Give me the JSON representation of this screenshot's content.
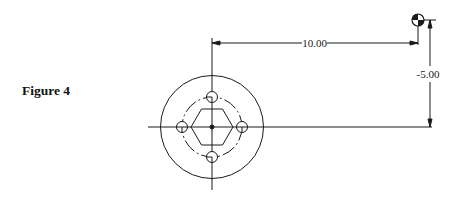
{
  "figure": {
    "label": "Figure 4"
  },
  "drawing": {
    "type": "engineering-drawing",
    "part": "circular flange with hexagonal center and 4-hole bolt circle",
    "dimensions": {
      "horizontal": "10.00",
      "vertical": "-5.00"
    },
    "datum_symbol": "center-of-gravity-icon",
    "features": {
      "outer_circle": true,
      "bolt_circle_dashed": true,
      "bolt_holes": 4,
      "hexagon": true,
      "center_point": true
    },
    "colors": {
      "line": "#1a1a1a",
      "background": "#ffffff"
    }
  }
}
